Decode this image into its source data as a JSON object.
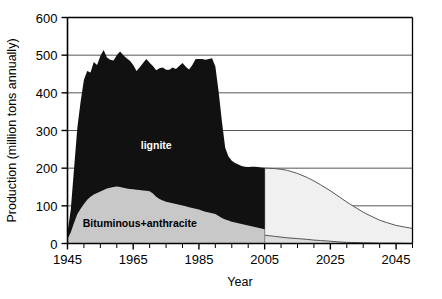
{
  "chart_data": {
    "type": "area",
    "subtype": "stacked-area-with-forecast",
    "title": "",
    "xlabel": "Year",
    "ylabel": "Production (million tons annually)",
    "xlim": [
      1945,
      2050
    ],
    "ylim": [
      0,
      600
    ],
    "grid": true,
    "grid_axis": "y",
    "legend_position": "inline-annotations",
    "x_tick_interval": 5,
    "x_label_interval": 20,
    "y_tick_interval": 100,
    "x_ticks": [
      1945,
      1950,
      1955,
      1960,
      1965,
      1970,
      1975,
      1980,
      1985,
      1990,
      1995,
      2000,
      2005,
      2010,
      2015,
      2020,
      2025,
      2030,
      2035,
      2040,
      2045,
      2050
    ],
    "x_tick_labels": [
      "1945",
      "",
      "",
      "",
      "1965",
      "",
      "",
      "",
      "1985",
      "",
      "",
      "",
      "2005",
      "",
      "",
      "",
      "2025",
      "",
      "",
      "",
      "2045",
      ""
    ],
    "x_labeled_ticks": [
      {
        "value": 1945,
        "label": "1945"
      },
      {
        "value": 1965,
        "label": "1965"
      },
      {
        "value": 1985,
        "label": "1985"
      },
      {
        "value": 2005,
        "label": "2005"
      },
      {
        "value": 2025,
        "label": "2025"
      },
      {
        "value": 2045,
        "label": "2045"
      }
    ],
    "y_ticks": [
      0,
      100,
      200,
      300,
      400,
      500,
      600
    ],
    "y_tick_labels": [
      "0",
      "100",
      "200",
      "300",
      "400",
      "500",
      "600"
    ],
    "annotations": [
      {
        "text": "lignite",
        "x": 1972,
        "y": 250,
        "color": "#ffffff",
        "name": "lignite-label"
      },
      {
        "text": "Bituminous+anthracite",
        "x": 1967,
        "y": 45,
        "color": "#000000",
        "name": "bituminous-anthracite-label"
      }
    ],
    "colors": {
      "lignite": "#111111",
      "bituminous_anthracite": "#c8c8c8",
      "forecast_total": "#f0f0f0",
      "forecast_lower": "#dcdcdc",
      "axis": "#000000",
      "grid": "#555555"
    },
    "series": [
      {
        "name": "Bituminous+anthracite",
        "phase": "historical",
        "color": "#c8c8c8",
        "x": [
          1945,
          1946,
          1947,
          1948,
          1949,
          1950,
          1951,
          1952,
          1953,
          1954,
          1955,
          1956,
          1957,
          1958,
          1959,
          1960,
          1961,
          1962,
          1963,
          1964,
          1965,
          1966,
          1967,
          1968,
          1969,
          1970,
          1971,
          1972,
          1973,
          1974,
          1975,
          1976,
          1977,
          1978,
          1979,
          1980,
          1981,
          1982,
          1983,
          1984,
          1985,
          1986,
          1987,
          1988,
          1989,
          1990,
          1991,
          1992,
          1993,
          1994,
          1995,
          1996,
          1997,
          1998,
          1999,
          2000,
          2001,
          2002,
          2003,
          2004,
          2005
        ],
        "values": [
          12,
          30,
          55,
          78,
          92,
          105,
          116,
          124,
          130,
          134,
          138,
          142,
          146,
          148,
          150,
          151,
          150,
          148,
          146,
          145,
          144,
          143,
          142,
          141,
          140,
          139,
          133,
          124,
          118,
          114,
          111,
          109,
          107,
          105,
          103,
          101,
          99,
          96,
          94,
          92,
          90,
          87,
          84,
          82,
          80,
          78,
          73,
          68,
          64,
          61,
          58,
          56,
          54,
          52,
          50,
          48,
          46,
          44,
          42,
          40,
          38
        ]
      },
      {
        "name": "lignite",
        "phase": "historical",
        "color": "#111111",
        "note": "stacked on top of Bituminous+anthracite; values are the lignite component only",
        "x": [
          1945,
          1946,
          1947,
          1948,
          1949,
          1950,
          1951,
          1952,
          1953,
          1954,
          1955,
          1956,
          1957,
          1958,
          1959,
          1960,
          1961,
          1962,
          1963,
          1964,
          1965,
          1966,
          1967,
          1968,
          1969,
          1970,
          1971,
          1972,
          1973,
          1974,
          1975,
          1976,
          1977,
          1978,
          1979,
          1980,
          1981,
          1982,
          1983,
          1984,
          1985,
          1986,
          1987,
          1988,
          1989,
          1990,
          1991,
          1992,
          1993,
          1994,
          1995,
          1996,
          1997,
          1998,
          1999,
          2000,
          2001,
          2002,
          2003,
          2004,
          2005
        ],
        "values": [
          18,
          60,
          145,
          230,
          285,
          330,
          342,
          330,
          352,
          340,
          360,
          372,
          348,
          340,
          336,
          349,
          360,
          352,
          346,
          340,
          330,
          315,
          326,
          338,
          350,
          341,
          338,
          336,
          347,
          353,
          350,
          352,
          360,
          358,
          368,
          378,
          370,
          366,
          380,
          398,
          400,
          403,
          404,
          408,
          412,
          392,
          330,
          256,
          190,
          170,
          162,
          158,
          156,
          154,
          154,
          155,
          158,
          160,
          161,
          162,
          163
        ]
      },
      {
        "name": "Total (historical)",
        "phase": "historical",
        "color": "#111111",
        "note": "top edge of the stacked historical area",
        "x": [
          1945,
          1946,
          1947,
          1948,
          1949,
          1950,
          1951,
          1952,
          1953,
          1954,
          1955,
          1956,
          1957,
          1958,
          1959,
          1960,
          1961,
          1962,
          1963,
          1964,
          1965,
          1966,
          1967,
          1968,
          1969,
          1970,
          1971,
          1972,
          1973,
          1974,
          1975,
          1976,
          1977,
          1978,
          1979,
          1980,
          1981,
          1982,
          1983,
          1984,
          1985,
          1986,
          1987,
          1988,
          1989,
          1990,
          1991,
          1992,
          1993,
          1994,
          1995,
          1996,
          1997,
          1998,
          1999,
          2000,
          2001,
          2002,
          2003,
          2004,
          2005
        ],
        "values": [
          30,
          90,
          200,
          308,
          377,
          435,
          458,
          454,
          482,
          474,
          498,
          514,
          494,
          488,
          486,
          500,
          510,
          500,
          492,
          485,
          474,
          458,
          468,
          479,
          490,
          480,
          471,
          460,
          465,
          467,
          461,
          461,
          467,
          463,
          471,
          479,
          469,
          462,
          474,
          490,
          490,
          490,
          488,
          490,
          492,
          470,
          403,
          324,
          254,
          231,
          220,
          214,
          210,
          206,
          204,
          203,
          204,
          204,
          203,
          202,
          201
        ]
      },
      {
        "name": "Forecast total",
        "phase": "forecast",
        "color": "#f0f0f0",
        "x": [
          2005,
          2008,
          2010,
          2012,
          2015,
          2018,
          2020,
          2022,
          2025,
          2028,
          2030,
          2032,
          2035,
          2038,
          2040,
          2042,
          2045,
          2048,
          2050
        ],
        "values": [
          200,
          199,
          197,
          194,
          186,
          175,
          166,
          156,
          140,
          122,
          110,
          99,
          83,
          70,
          62,
          56,
          48,
          43,
          40
        ]
      },
      {
        "name": "Forecast Bituminous+anthracite",
        "phase": "forecast",
        "color": "#dcdcdc",
        "x": [
          2005,
          2008,
          2010,
          2012,
          2015,
          2018,
          2020,
          2022,
          2025,
          2028,
          2030,
          2035,
          2040,
          2045,
          2050
        ],
        "values": [
          22,
          19,
          17,
          15,
          13,
          11,
          9,
          8,
          6,
          4,
          3,
          2,
          1,
          1,
          0
        ]
      }
    ]
  }
}
